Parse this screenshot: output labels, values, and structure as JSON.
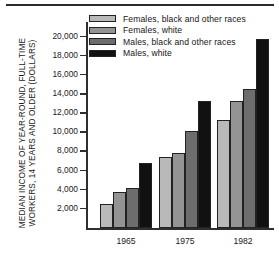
{
  "chart_data": {
    "type": "bar",
    "title": "",
    "xlabel": "",
    "ylabel": "MEDIAN INCOME OF YEAR-ROUND, FULL-TIME WORKERS, 14 YEARS AND OLDER (DOLLARS)",
    "ylabel_lines": [
      "MEDIAN INCOME OF YEAR-ROUND, FULL-TIME",
      "WORKERS, 14 YEARS AND OLDER (DOLLARS)"
    ],
    "categories": [
      "1965",
      "1975",
      "1982"
    ],
    "ylim": [
      0,
      21000
    ],
    "ytick_values": [
      2000,
      4000,
      6000,
      8000,
      10000,
      12000,
      14000,
      16000,
      18000,
      20000
    ],
    "ytick_labels": [
      "2,000",
      "4,000",
      "6,000",
      "8,000",
      "10,000",
      "12,000",
      "14,000",
      "16,000",
      "18,000",
      "20,000"
    ],
    "grid": false,
    "legend_position": "top-center",
    "series": [
      {
        "name": "Females, black and other races",
        "color": "#b9b9b9",
        "values": [
          2500,
          7400,
          11300
        ]
      },
      {
        "name": "Females, white",
        "color": "#949494",
        "values": [
          3800,
          7800,
          13300
        ]
      },
      {
        "name": "Males, black and other races",
        "color": "#6d6d6d",
        "values": [
          4200,
          10150,
          14500
        ]
      },
      {
        "name": "Males, white",
        "color": "#111111",
        "values": [
          6750,
          13250,
          19800
        ]
      }
    ]
  },
  "colors": {
    "background": "#ffffff",
    "axis": "#2e2e2e",
    "text": "#1a1a1a",
    "rule": "#2a2a2a"
  }
}
